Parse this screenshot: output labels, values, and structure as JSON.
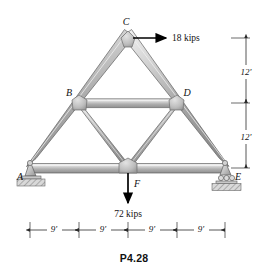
{
  "figure": {
    "caption": "P4.28",
    "background_color": "#ffffff",
    "member_fill_light": "#e8e8e8",
    "member_fill_mid": "#b9b9b9",
    "member_fill_dark": "#8a8a8a",
    "outline_color": "#5a5a5a",
    "gusset_color": "#bdbdbd"
  },
  "joints": [
    {
      "id": "A",
      "label": "A",
      "x": 30,
      "y": 168,
      "label_x": 20,
      "label_y": 178,
      "support": "pin"
    },
    {
      "id": "B",
      "label": "B",
      "x": 79,
      "y": 103,
      "label_x": 70,
      "label_y": 97,
      "support": "none"
    },
    {
      "id": "C",
      "label": "C",
      "x": 128,
      "y": 38,
      "label_x": 125,
      "label_y": 26,
      "support": "none"
    },
    {
      "id": "D",
      "label": "D",
      "x": 177,
      "y": 103,
      "label_x": 181,
      "label_y": 97,
      "support": "none"
    },
    {
      "id": "E",
      "label": "E",
      "x": 225,
      "y": 168,
      "label_x": 232,
      "label_y": 178,
      "support": "roller"
    },
    {
      "id": "F",
      "label": "F",
      "x": 128,
      "y": 168,
      "label_x": 133,
      "label_y": 186,
      "support": "none"
    }
  ],
  "members": [
    {
      "from": "A",
      "to": "C",
      "kind": "chord"
    },
    {
      "from": "C",
      "to": "E",
      "kind": "chord"
    },
    {
      "from": "A",
      "to": "E",
      "kind": "bottom-chord"
    },
    {
      "from": "B",
      "to": "D",
      "kind": "tie"
    },
    {
      "from": "B",
      "to": "F",
      "kind": "diagonal"
    },
    {
      "from": "D",
      "to": "F",
      "kind": "diagonal"
    }
  ],
  "loads": [
    {
      "id": "load-C",
      "magnitude": "18 kips",
      "direction": "right",
      "at_joint": "C",
      "tail_x": 133,
      "tail_y": 38,
      "head_x": 168,
      "head_y": 38,
      "label_x": 172,
      "label_y": 41
    },
    {
      "id": "load-F",
      "magnitude": "72 kips",
      "direction": "down",
      "at_joint": "F",
      "tail_x": 128,
      "tail_y": 172,
      "head_x": 128,
      "head_y": 205,
      "label_x": 128,
      "label_y": 217
    }
  ],
  "vertical_dimensions": [
    {
      "id": "dim-upper",
      "label": "12'",
      "top_y": 38,
      "bottom_y": 103,
      "line_x": 246,
      "label_x": 254,
      "label_y": 74
    },
    {
      "id": "dim-lower",
      "label": "12'",
      "top_y": 103,
      "bottom_y": 168,
      "line_x": 246,
      "label_x": 254,
      "label_y": 139
    }
  ],
  "horizontal_dimensions": {
    "line_y": 230,
    "label_y": 227,
    "segments": [
      {
        "id": "span-1",
        "label": "9'",
        "x1": 30,
        "x2": 79,
        "label_x": 54
      },
      {
        "id": "span-2",
        "label": "9'",
        "x1": 79,
        "x2": 128,
        "label_x": 103
      },
      {
        "id": "span-3",
        "label": "9'",
        "x1": 128,
        "x2": 177,
        "label_x": 152
      },
      {
        "id": "span-4",
        "label": "9'",
        "x1": 177,
        "x2": 225,
        "label_x": 201
      }
    ]
  }
}
